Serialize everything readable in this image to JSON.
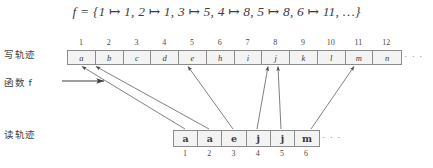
{
  "figure": {
    "formula": {
      "lhs": "f",
      "eq": "=",
      "body": "{1 ↦ 1, 2 ↦ 1, 3 ↦ 5, 4 ↦ 8, 5 ↦ 8, 6 ↦ 11, …}",
      "full": "f  =  {1 ↦ 1, 2 ↦ 1, 3 ↦ 5, 4 ↦ 8, 5 ↦ 8, 6 ↦ 11, …}"
    },
    "labels": {
      "write_track": "写轨迹",
      "function": "函数 f",
      "read_track": "读轨迹"
    },
    "write_tape": {
      "indices": [
        "1",
        "2",
        "3",
        "4",
        "5",
        "6",
        "7",
        "8",
        "9",
        "10",
        "11",
        "12"
      ],
      "cells": [
        "a",
        "b",
        "c",
        "d",
        "e",
        "h",
        "i",
        "j",
        "k",
        "l",
        "m",
        "n"
      ],
      "ellipsis": "· · ·"
    },
    "read_tape": {
      "indices": [
        "1",
        "2",
        "3",
        "4",
        "5",
        "6"
      ],
      "cells": [
        "a",
        "a",
        "e",
        "j",
        "j",
        "m"
      ],
      "ellipsis": "· · ·"
    },
    "mapping": [
      {
        "from": 1,
        "to": 1
      },
      {
        "from": 2,
        "to": 1
      },
      {
        "from": 3,
        "to": 5
      },
      {
        "from": 4,
        "to": 8
      },
      {
        "from": 5,
        "to": 8
      },
      {
        "from": 6,
        "to": 11
      }
    ],
    "colors": {
      "line": "#555555",
      "cell_fill": "#f3f3f3",
      "cell_border": "#8c8c8c",
      "text": "#3a3a3a"
    }
  }
}
